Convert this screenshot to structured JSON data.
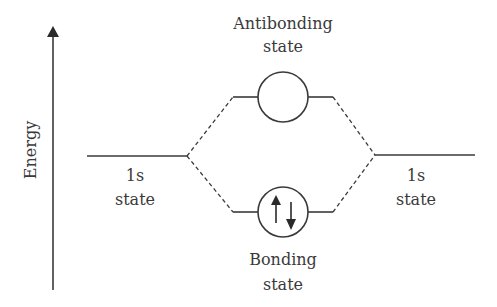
{
  "diagram": {
    "type": "molecular-orbital-energy-diagram",
    "axis": {
      "label": "Energy",
      "direction": "up"
    },
    "left_level": {
      "line1": "1s",
      "line2": "state"
    },
    "right_level": {
      "line1": "1s",
      "line2": "state"
    },
    "antibonding": {
      "line1": "Antibonding",
      "line2": "state",
      "electrons": 0
    },
    "bonding": {
      "line1": "Bonding",
      "line2": "state",
      "electrons": 2,
      "spins": [
        "up",
        "down"
      ]
    },
    "colors": {
      "stroke": "#3a3a3a",
      "background": "#ffffff"
    }
  }
}
